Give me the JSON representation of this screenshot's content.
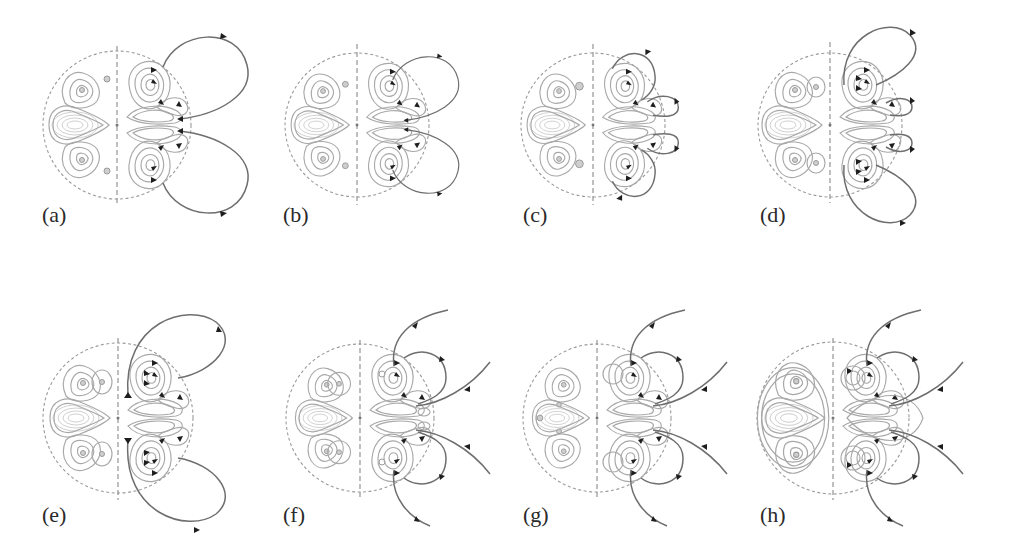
{
  "figure": {
    "colors": {
      "background": "#ffffff",
      "contour": "#a8a8a8",
      "fieldline": "#6e6e6e",
      "arrow": "#1e1e1e",
      "boundary": "#9a9a9a",
      "label": "#2a2a2a"
    },
    "panels": [
      {
        "id": "a",
        "label": "(a)",
        "cx": 117,
        "cy": 125,
        "r": 74,
        "outer_lines": "closed",
        "label_x": 42,
        "label_y": 222
      },
      {
        "id": "b",
        "label": "(b)",
        "cx": 357,
        "cy": 125,
        "r": 72,
        "outer_lines": "closed",
        "label_x": 283,
        "label_y": 222
      },
      {
        "id": "c",
        "label": "(c)",
        "cx": 593,
        "cy": 125,
        "r": 72,
        "outer_lines": "closed",
        "label_x": 523,
        "label_y": 222
      },
      {
        "id": "d",
        "label": "(d)",
        "cx": 830,
        "cy": 125,
        "r": 72,
        "outer_lines": "closed",
        "label_x": 760,
        "label_y": 222
      },
      {
        "id": "e",
        "label": "(e)",
        "cx": 118,
        "cy": 418,
        "r": 75,
        "outer_lines": "closed",
        "label_x": 42,
        "label_y": 522
      },
      {
        "id": "f",
        "label": "(f)",
        "cx": 360,
        "cy": 418,
        "r": 74,
        "outer_lines": "open",
        "label_x": 283,
        "label_y": 522
      },
      {
        "id": "g",
        "label": "(g)",
        "cx": 597,
        "cy": 418,
        "r": 74,
        "outer_lines": "open",
        "label_x": 523,
        "label_y": 522
      },
      {
        "id": "h",
        "label": "(h)",
        "cx": 833,
        "cy": 418,
        "r": 76,
        "outer_lines": "open",
        "label_x": 760,
        "label_y": 522
      }
    ]
  }
}
